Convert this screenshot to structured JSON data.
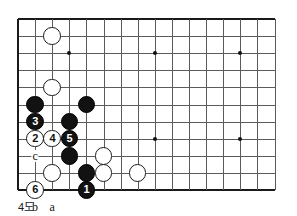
{
  "figure": {
    "caption": "4도",
    "type": "go-board-diagram"
  },
  "board": {
    "columns": 16,
    "rows": 11,
    "origin_x": 18,
    "origin_y": 19,
    "spacing": 17.1,
    "line_color": "#5a5a5a",
    "edge_color": "#1a1a1a",
    "background": "#ffffff",
    "star_points": [
      {
        "col": 3,
        "row": 2
      },
      {
        "col": 8,
        "row": 2
      },
      {
        "col": 13,
        "row": 2
      },
      {
        "col": 8,
        "row": 7
      },
      {
        "col": 13,
        "row": 7
      }
    ]
  },
  "stones": [
    {
      "color": "white",
      "col": 2,
      "row": 1,
      "label": ""
    },
    {
      "color": "white",
      "col": 2,
      "row": 4,
      "label": ""
    },
    {
      "color": "black",
      "col": 1,
      "row": 5,
      "label": ""
    },
    {
      "color": "black",
      "col": 4,
      "row": 5,
      "label": ""
    },
    {
      "color": "black",
      "col": 1,
      "row": 6,
      "label": "3"
    },
    {
      "color": "black",
      "col": 3,
      "row": 6,
      "label": ""
    },
    {
      "color": "white",
      "col": 1,
      "row": 7,
      "label": "2"
    },
    {
      "color": "white",
      "col": 2,
      "row": 7,
      "label": "4"
    },
    {
      "color": "black",
      "col": 3,
      "row": 7,
      "label": "5"
    },
    {
      "color": "black",
      "col": 3,
      "row": 8,
      "label": ""
    },
    {
      "color": "white",
      "col": 5,
      "row": 8,
      "label": ""
    },
    {
      "color": "white",
      "col": 2,
      "row": 9,
      "label": ""
    },
    {
      "color": "black",
      "col": 4,
      "row": 9,
      "label": ""
    },
    {
      "color": "white",
      "col": 5,
      "row": 9,
      "label": ""
    },
    {
      "color": "white",
      "col": 7,
      "row": 9,
      "label": ""
    },
    {
      "color": "white",
      "col": 1,
      "row": 10,
      "label": "6"
    },
    {
      "color": "black",
      "col": 4,
      "row": 10,
      "label": "1"
    }
  ],
  "point_labels": [
    {
      "text": "c",
      "col": 1,
      "row": 8
    },
    {
      "text": "b",
      "col": 1,
      "row": 11
    },
    {
      "text": "a",
      "col": 2,
      "row": 11
    }
  ],
  "colors": {
    "black_stone": "#121212",
    "white_stone": "#ffffff",
    "stone_outline": "#1a1a1a",
    "text": "#111111"
  }
}
